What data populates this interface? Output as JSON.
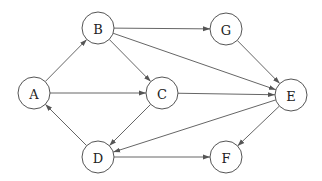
{
  "diagram": {
    "type": "directed-graph",
    "node_radius": 16,
    "colors": {
      "stroke": "#555555",
      "edge": "#666666",
      "text": "#222222",
      "background": "#ffffff"
    },
    "nodes": [
      {
        "id": "A",
        "label": "A",
        "x": 34,
        "y": 93
      },
      {
        "id": "B",
        "label": "B",
        "x": 98,
        "y": 28
      },
      {
        "id": "G",
        "label": "G",
        "x": 226,
        "y": 29
      },
      {
        "id": "C",
        "label": "C",
        "x": 162,
        "y": 93
      },
      {
        "id": "E",
        "label": "E",
        "x": 291,
        "y": 95
      },
      {
        "id": "D",
        "label": "D",
        "x": 98,
        "y": 157
      },
      {
        "id": "F",
        "label": "F",
        "x": 226,
        "y": 157
      }
    ],
    "edges": [
      {
        "from": "A",
        "to": "B"
      },
      {
        "from": "A",
        "to": "C"
      },
      {
        "from": "B",
        "to": "G"
      },
      {
        "from": "B",
        "to": "C"
      },
      {
        "from": "B",
        "to": "E"
      },
      {
        "from": "G",
        "to": "E"
      },
      {
        "from": "C",
        "to": "E"
      },
      {
        "from": "C",
        "to": "D"
      },
      {
        "from": "E",
        "to": "D"
      },
      {
        "from": "E",
        "to": "F"
      },
      {
        "from": "D",
        "to": "A"
      },
      {
        "from": "D",
        "to": "F"
      }
    ]
  }
}
